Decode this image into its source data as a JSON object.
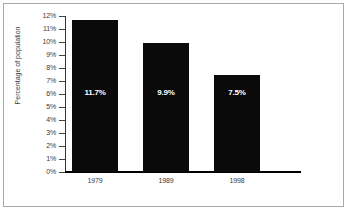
{
  "chart_data": {
    "type": "bar",
    "title": "",
    "xlabel": "",
    "ylabel": "Percentage of population",
    "categories": [
      "1979",
      "1989",
      "1998"
    ],
    "values": [
      11.7,
      9.9,
      7.5
    ],
    "data_labels": [
      "11.7%",
      "9.9%",
      "7.5%"
    ],
    "ylim": [
      0,
      12
    ],
    "ytick_values": [
      12,
      11,
      10,
      9,
      8,
      7,
      6,
      5,
      4,
      3,
      2,
      1,
      0
    ],
    "ytick_labels": [
      "12%",
      "11%",
      "10%",
      "9%",
      "8%",
      "7%",
      "6%",
      "5%",
      "4%",
      "3%",
      "2%",
      "1%",
      "0%"
    ],
    "grid": false,
    "legend": null,
    "bar_color": "#0a0a0a",
    "label_color": "#ffffff",
    "axis_color": "#333333",
    "frame_color": "#a8a8a8",
    "background": "#ffffff"
  }
}
